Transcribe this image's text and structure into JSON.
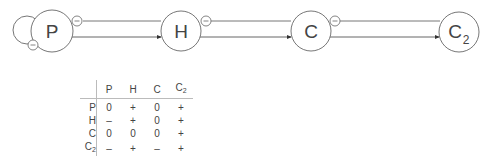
{
  "diagram": {
    "nodes": [
      {
        "id": "P",
        "label": "P",
        "sub": ""
      },
      {
        "id": "H",
        "label": "H",
        "sub": ""
      },
      {
        "id": "C",
        "label": "C",
        "sub": ""
      },
      {
        "id": "C2",
        "label": "C",
        "sub": "2"
      }
    ],
    "badge_symbol": "−",
    "edges": [
      {
        "from": "P",
        "to": "P",
        "sign": "−",
        "type": "self-loop"
      },
      {
        "from": "P",
        "to": "H",
        "sign": "−",
        "type": "inhibit"
      },
      {
        "from": "P",
        "to": "H",
        "sign": "+",
        "type": "activate"
      },
      {
        "from": "H",
        "to": "C",
        "sign": "−",
        "type": "inhibit"
      },
      {
        "from": "H",
        "to": "C",
        "sign": "+",
        "type": "activate"
      },
      {
        "from": "C",
        "to": "C2",
        "sign": "−",
        "type": "inhibit"
      },
      {
        "from": "C",
        "to": "C2",
        "sign": "+",
        "type": "activate"
      }
    ]
  },
  "table": {
    "columns": [
      {
        "label": "P",
        "sub": ""
      },
      {
        "label": "H",
        "sub": ""
      },
      {
        "label": "C",
        "sub": ""
      },
      {
        "label": "C",
        "sub": "2"
      }
    ],
    "rows": [
      {
        "label": "P",
        "sub": "",
        "cells": [
          "0",
          "+",
          "0",
          "+"
        ]
      },
      {
        "label": "H",
        "sub": "",
        "cells": [
          "–",
          "+",
          "0",
          "+"
        ]
      },
      {
        "label": "C",
        "sub": "",
        "cells": [
          "0",
          "0",
          "0",
          "+"
        ]
      },
      {
        "label": "C",
        "sub": "2",
        "cells": [
          "–",
          "+",
          "–",
          "+"
        ]
      }
    ]
  },
  "colors": {
    "stroke": "#555555",
    "text": "#444444",
    "rule": "#bbbbbb"
  }
}
